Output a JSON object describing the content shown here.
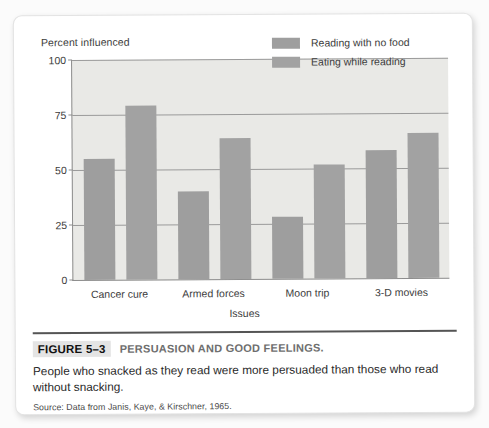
{
  "figure": {
    "number": "FIGURE 5–3",
    "title": "PERSUASION AND GOOD FEELINGS.",
    "body": "People who snacked as they read were more persuaded than those who read without snacking.",
    "source": "Source: Data from Janis, Kaye, & Kirschner, 1965."
  },
  "chart_data": {
    "type": "bar",
    "title": "",
    "xlabel": "Issues",
    "ylabel": "Percent influenced",
    "categories": [
      "Cancer cure",
      "Armed forces",
      "Moon trip",
      "3-D movies"
    ],
    "series": [
      {
        "name": "Reading with no food",
        "color": "#9e9e9e",
        "values": [
          55,
          40,
          28,
          58
        ]
      },
      {
        "name": "Eating while reading",
        "color": "#a2a2a2",
        "values": [
          79,
          64,
          52,
          66
        ]
      }
    ],
    "ylim": [
      0,
      100
    ],
    "yticks": [
      0,
      25,
      50,
      75,
      100
    ],
    "ytick_labels": [
      "0",
      "25",
      "50",
      "75",
      "100"
    ],
    "grid": true,
    "legend_position": "top-right",
    "plot_background": "#e9e9e6",
    "axis_color": "#8d8d8d"
  }
}
